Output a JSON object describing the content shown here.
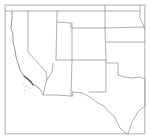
{
  "map": {
    "region": "Southwestern United States",
    "background": "#ffffff",
    "border_color": "#9a9a9a",
    "frame_color": "#c9c9c9",
    "labels": [],
    "frame": {
      "x": 5.5,
      "y": 5.5,
      "width": 139,
      "height": 128
    },
    "states": [
      {
        "name": "California",
        "path": "M12,11 L12,20 L11,28 L14,36 L13,44 L16,52 L17,60 L20,70 L24,78 L30,82 L35,86 L40,89 L43,95 L57,93 L47,80 L46,72 L28,52 L28,18 Z"
      },
      {
        "name": "Nevada",
        "path": "M28,18 L57,22 L56,60 L53,63 L52,72 L47,80 L46,72 L28,52 Z"
      },
      {
        "name": "Utah",
        "path": "M57,22 L71,23 L71,28 L72,28 L72,60 L56,60 Z"
      },
      {
        "name": "Arizona",
        "path": "M56,60 L72,60 L71,96 L57,95 L43,95 L40,89 L47,80 L52,72 L53,63 Z"
      },
      {
        "name": "Colorado",
        "path": "M72,28 L105,28 L106,60 L72,60 Z"
      },
      {
        "name": "New Mexico",
        "path": "M72,60 L106,60 L106,92 L89,92 L88,93 L82,93 L82,96 L73,96 L71,96 Z"
      },
      {
        "name": "Wyoming",
        "path": "M72,5 L105,5 L105,28 L72,28 L71,23 L71,5 Z"
      },
      {
        "name": "Idaho/Oregon edge",
        "path": "M12,11 L57,11 L57,22"
      },
      {
        "name": "Nebraska",
        "path": "M105,5 L140,5 L140,18 L144,27 L140,27 L105,28"
      },
      {
        "name": "Kansas",
        "path": "M106,28 L144,27 L145,42 L106,42"
      },
      {
        "name": "Oklahoma",
        "path": "M106,42 L145,42 L145,80 L132,77 L118,75 L118,63 L106,63"
      },
      {
        "name": "Texas",
        "path": "M106,60 L118,63 L118,75 L132,77 L145,80 L145,104 L140,106 L137,116 L135,128 L128,134 L120,130 L116,119 L109,112 L104,106 L98,103 L90,97 L82,93 L88,93 L89,92 L106,92 Z"
      }
    ],
    "lines": [
      {
        "name": "northern-border-line",
        "path": "M5,11 L140,11"
      },
      {
        "name": "ca-nv-border",
        "path": "M28,11 L28,52 L46,72 L47,80"
      },
      {
        "name": "nv-ut-border",
        "path": "M57,11 L56,60"
      },
      {
        "name": "ut-co-border",
        "path": "M72,23 L72,60"
      },
      {
        "name": "ut-wy-notch",
        "path": "M57,22 L71,23 L71,28 L105,28"
      },
      {
        "name": "wy-ne-border",
        "path": "M105,5 L105,28"
      },
      {
        "name": "ne-ks-border",
        "path": "M105,28 L144,27"
      },
      {
        "name": "ks-ok-border",
        "path": "M106,42 L145,42"
      },
      {
        "name": "ne-east-river",
        "path": "M140,5 L140,18 L143,24 L145,30"
      },
      {
        "name": "co-east-border",
        "path": "M105,28 L106,60"
      },
      {
        "name": "four-corners-line",
        "path": "M56,60 L106,60"
      },
      {
        "name": "az-nm-border",
        "path": "M72,60 L71,96"
      },
      {
        "name": "nm-tx-border",
        "path": "M106,60 L106,92 L89,92"
      },
      {
        "name": "tx-panhandle-north",
        "path": "M106,63 L118,63 L118,75"
      },
      {
        "name": "red-river",
        "path": "M118,75 L124,77 L132,78 L140,77 L145,79"
      },
      {
        "name": "ca-az-border",
        "path": "M53,63 L52,72 L47,80 L45,86 L43,95"
      },
      {
        "name": "mexico-border-west",
        "path": "M40,89 L43,95 L57,95 L71,96 L73,96 L72,92 L82,93"
      },
      {
        "name": "rio-grande",
        "path": "M82,93 L90,97 L98,103 L104,106 L109,112 L114,116 L117,122 L120,128 L124,132 L128,134"
      },
      {
        "name": "gulf-coast",
        "path": "M128,134 L130,128 L132,122 L135,117 L138,112 L141,109 L145,106"
      },
      {
        "name": "tx-east-border",
        "path": "M145,80 L145,106"
      }
    ],
    "coastline": {
      "california": "M12,11 L12,20 L11,28 L13,34 L13,42 L15,50 L16,57 L18,63 L20,70 L24,76 L28,80 L32,83 L36,86 L40,89",
      "socal_dark": "M24,76 L28,79 L31,82 L33,85"
    },
    "islands": [
      {
        "cx": 23,
        "cy": 84,
        "r": 0.6
      },
      {
        "cx": 26,
        "cy": 86,
        "r": 0.6
      },
      {
        "cx": 30,
        "cy": 88,
        "r": 0.5
      },
      {
        "cx": 25,
        "cy": 90,
        "r": 0.5
      }
    ]
  }
}
